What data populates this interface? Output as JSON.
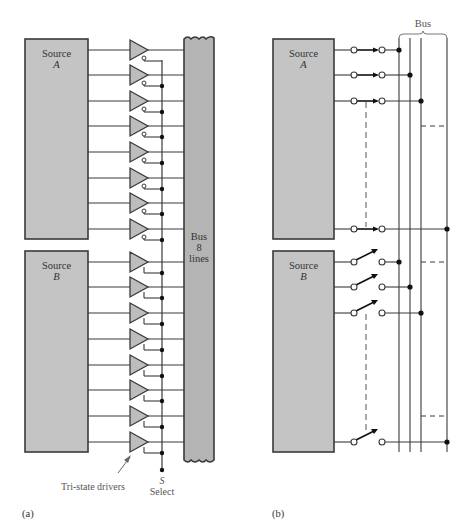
{
  "panel_a": {
    "caption": "(a)",
    "source_a": {
      "title": "Source",
      "letter": "A"
    },
    "source_b": {
      "title": "Source",
      "letter": "B"
    },
    "bus": {
      "line1": "Bus",
      "line2": "8",
      "line3": "lines"
    },
    "drivers_label": "Tri-state drivers",
    "select_symbol": "S",
    "select_label": "Select",
    "rows_a": [
      50,
      75,
      101,
      126,
      152,
      178,
      203,
      229
    ],
    "rows_b": [
      262,
      287,
      313,
      339,
      365,
      390,
      416,
      442
    ],
    "driver_count_per_source": 8,
    "source_a_enable": "inverted",
    "source_b_enable": "active-high"
  },
  "panel_b": {
    "caption": "(b)",
    "bus_label": "Bus",
    "source_a": {
      "title": "Source",
      "letter": "A",
      "switches": "closed"
    },
    "source_b": {
      "title": "Source",
      "letter": "B",
      "switches": "open"
    },
    "rows_a": [
      50,
      75,
      101,
      229
    ],
    "rows_b": [
      262,
      287,
      313,
      442
    ],
    "bus_lines_x": [
      399,
      410,
      421,
      447
    ]
  },
  "colors": {
    "box_fill": "#c4c4c4",
    "box_stroke": "#3a3a3a",
    "line": "#3a3a3a",
    "bus_fill": "#b4b4b4",
    "label_gray": "#666666"
  }
}
